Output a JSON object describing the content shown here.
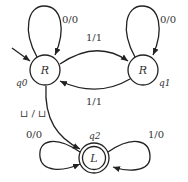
{
  "diagram": {
    "type": "finite-state-transducer",
    "states": [
      {
        "id": "q0",
        "name": "q0",
        "label": "R",
        "start": true,
        "accepting": false
      },
      {
        "id": "q1",
        "name": "q1",
        "label": "R",
        "start": false,
        "accepting": false
      },
      {
        "id": "q2",
        "name": "q2",
        "label": "L",
        "start": false,
        "accepting": true
      }
    ],
    "transitions": [
      {
        "from": "q0",
        "to": "q0",
        "label": "0/0"
      },
      {
        "from": "q0",
        "to": "q1",
        "label": "1/1"
      },
      {
        "from": "q1",
        "to": "q1",
        "label": "0/0"
      },
      {
        "from": "q1",
        "to": "q0",
        "label": "1/1"
      },
      {
        "from": "q0",
        "to": "q2",
        "label": "⊔ / ⊔"
      },
      {
        "from": "q2",
        "to": "q2",
        "label": "0/0",
        "side": "left"
      },
      {
        "from": "q2",
        "to": "q2",
        "label": "1/0",
        "side": "right"
      }
    ]
  }
}
